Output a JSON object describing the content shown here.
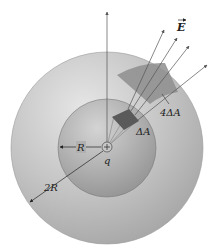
{
  "diagram": {
    "labels": {
      "field": "E",
      "small_area": "ΔA",
      "large_area": "4ΔA",
      "inner_radius": "R",
      "outer_radius": "2R",
      "charge": "q"
    },
    "colors": {
      "outer_sphere": "#b5b5b5",
      "inner_sphere": "#a9a9a9",
      "small_patch": "#5a5a5a",
      "large_patch": "#8e8e8e",
      "field_lines": "#555555"
    }
  }
}
